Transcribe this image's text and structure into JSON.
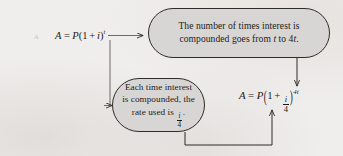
{
  "figure": {
    "kind": "flowchart",
    "background_color": "#f0eeec",
    "box_fill_color": "#d8d6d4",
    "box_border_color": "#2e2b28",
    "ink_color": "#1d1b19"
  },
  "formulas": {
    "source": {
      "full_text": "A = P(1 + i)^t",
      "A": "A",
      "equals": "=",
      "P": "P",
      "open_paren": "(",
      "one": "1",
      "plus": "+",
      "i": "i",
      "close_paren": ")",
      "exponent": "t"
    },
    "result": {
      "full_text": "A = P(1 + i/4)^4t",
      "A": "A",
      "equals": "=",
      "P": "P",
      "open_paren": "(",
      "one": "1",
      "plus": "+",
      "numerator": "i",
      "denominator": "4",
      "close_paren": ")",
      "exponent": "4t"
    }
  },
  "boxes": {
    "top": {
      "line1": "The number of times interest is",
      "line2_part1": "compounded goes from ",
      "line2_var1": "t",
      "line2_part2": " to 4",
      "line2_var2": "t",
      "line2_end": "."
    },
    "bottom": {
      "line1": "Each time interest",
      "line2": "is compounded, the",
      "line3_prefix": "rate used is ",
      "numerator": "i",
      "denominator": "4",
      "line3_suffix": "."
    }
  },
  "connectors": {
    "source_to_top_box": "arrow-right-from-source-formula-to-top-box",
    "source_to_bottom_box": "elbow-arrow-down-then-right-to-bottom-box",
    "top_box_to_exponent": "arrow-down-from-top-box-to-result-exponent",
    "bottom_box_to_fraction": "elbow-arrow-down-right-up-to-result-fraction"
  },
  "artifacts": {
    "left_scan_mark": "A"
  }
}
